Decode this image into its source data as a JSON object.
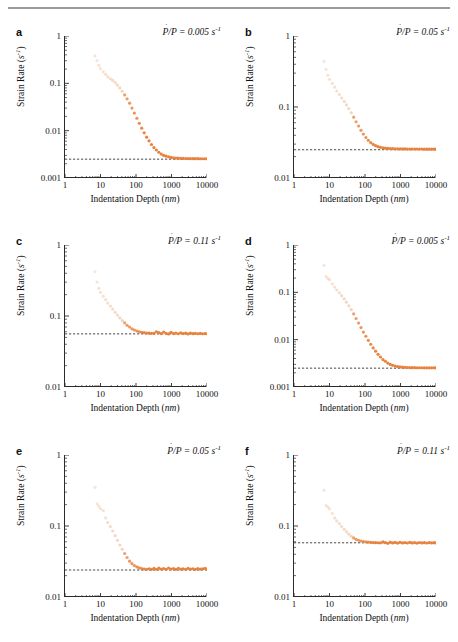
{
  "figure": {
    "type": "multi-panel-scatter",
    "panel_count": 6,
    "columns": 2,
    "rows": 3,
    "marker_color": "#E8823C",
    "marker_color_faded": "#EFC6A6",
    "axis_color": "#2b2b2b",
    "rule_color": "#9a9a9a"
  },
  "axes": {
    "xlabel_text": "Indentation Depth (",
    "xlabel_unit": "nm",
    "xlabel_close": ")",
    "ylabel_text": "Strain Rate (",
    "ylabel_unit": "s",
    "ylabel_exp": "-1",
    "ylabel_close": ")",
    "xticks": [
      "1",
      "10",
      "100",
      "1000",
      "10000"
    ],
    "xlim": [
      1,
      10000
    ],
    "yticks_3dec": [
      "1",
      "0.1",
      "0.01",
      "0.001"
    ],
    "yticks_2dec": [
      "1",
      "0.1",
      "0.01"
    ]
  },
  "annotation": {
    "numerator": "P",
    "denominator": "P",
    "separator": "/",
    "equals": " = ",
    "unit": "s",
    "unit_exp": "-1"
  },
  "chart_data": [
    {
      "panel": "a",
      "label": "a",
      "type": "scatter",
      "title": "",
      "xlabel": "Indentation Depth (nm)",
      "ylabel": "Strain Rate (s^-1)",
      "xlim": [
        1,
        10000
      ],
      "ylim": [
        0.001,
        1
      ],
      "xscale": "log",
      "yscale": "log",
      "grid": false,
      "legend": "none",
      "annotation_value": "0.005",
      "reference_line": 0.0025,
      "reference_line_style": "dashed",
      "x": [
        7,
        8,
        9,
        10,
        12,
        14,
        16,
        19,
        22,
        26,
        30,
        35,
        41,
        48,
        56,
        66,
        77,
        90,
        106,
        124,
        145,
        170,
        199,
        233,
        273,
        320,
        375,
        439,
        514,
        602,
        705,
        826,
        967,
        1133,
        1327,
        1554,
        1820,
        2132,
        2497,
        2925,
        3426,
        4013,
        4700,
        5505,
        6448,
        7553,
        8848,
        10000
      ],
      "y": [
        0.38,
        0.3,
        0.24,
        0.205,
        0.175,
        0.155,
        0.137,
        0.125,
        0.115,
        0.104,
        0.092,
        0.08,
        0.068,
        0.057,
        0.047,
        0.038,
        0.03,
        0.0235,
        0.0183,
        0.0143,
        0.0113,
        0.009,
        0.0073,
        0.0061,
        0.0051,
        0.0044,
        0.0039,
        0.0035,
        0.0032,
        0.003,
        0.0029,
        0.0028,
        0.00272,
        0.00268,
        0.00264,
        0.00262,
        0.0026,
        0.00259,
        0.00258,
        0.00257,
        0.00257,
        0.00256,
        0.00256,
        0.00256,
        0.00255,
        0.00255,
        0.00255,
        0.00255
      ]
    },
    {
      "panel": "b",
      "label": "b",
      "type": "scatter",
      "title": "",
      "xlabel": "Indentation Depth (nm)",
      "ylabel": "Strain Rate (s^-1)",
      "xlim": [
        1,
        10000
      ],
      "ylim": [
        0.01,
        1
      ],
      "xscale": "log",
      "yscale": "log",
      "grid": false,
      "legend": "none",
      "annotation_value": "0.05",
      "reference_line": 0.025,
      "reference_line_style": "dashed",
      "x": [
        7,
        8,
        9,
        10,
        12,
        14,
        16,
        19,
        22,
        26,
        30,
        35,
        41,
        48,
        56,
        66,
        77,
        90,
        106,
        124,
        145,
        170,
        199,
        233,
        273,
        320,
        375,
        439,
        514,
        602,
        705,
        826,
        967,
        1133,
        1327,
        1554,
        1820,
        2132,
        2497,
        2925,
        3426,
        4013,
        4700,
        5505,
        6448,
        7553,
        8848,
        10000
      ],
      "y": [
        0.44,
        0.34,
        0.28,
        0.245,
        0.215,
        0.19,
        0.168,
        0.15,
        0.134,
        0.12,
        0.107,
        0.095,
        0.083,
        0.072,
        0.062,
        0.054,
        0.047,
        0.0415,
        0.0372,
        0.034,
        0.0315,
        0.0297,
        0.0285,
        0.0276,
        0.027,
        0.0266,
        0.0263,
        0.0261,
        0.026,
        0.0259,
        0.0258,
        0.0258,
        0.0257,
        0.0257,
        0.0257,
        0.0256,
        0.0256,
        0.0256,
        0.0256,
        0.0256,
        0.0256,
        0.0256,
        0.0255,
        0.0255,
        0.0255,
        0.0255,
        0.0255,
        0.0255
      ]
    },
    {
      "panel": "c",
      "label": "c",
      "type": "scatter",
      "title": "",
      "xlabel": "Indentation Depth (nm)",
      "ylabel": "Strain Rate (s^-1)",
      "xlim": [
        1,
        10000
      ],
      "ylim": [
        0.01,
        1
      ],
      "xscale": "log",
      "yscale": "log",
      "grid": false,
      "legend": "none",
      "annotation_value": "0.11",
      "reference_line": 0.056,
      "reference_line_style": "dashed",
      "x": [
        7,
        8,
        9,
        10,
        12,
        14,
        16,
        19,
        22,
        26,
        30,
        35,
        41,
        48,
        56,
        66,
        77,
        90,
        106,
        124,
        145,
        170,
        199,
        233,
        273,
        320,
        375,
        439,
        514,
        602,
        705,
        826,
        967,
        1133,
        1327,
        1554,
        1820,
        2132,
        2497,
        2925,
        3426,
        4013,
        4700,
        5505,
        6448,
        7553,
        8848,
        10000
      ],
      "y": [
        0.42,
        0.3,
        0.245,
        0.215,
        0.19,
        0.17,
        0.152,
        0.138,
        0.125,
        0.113,
        0.103,
        0.094,
        0.086,
        0.08,
        0.074,
        0.07,
        0.066,
        0.0635,
        0.0615,
        0.06,
        0.059,
        0.0582,
        0.0576,
        0.0572,
        0.057,
        0.0568,
        0.06,
        0.0582,
        0.0566,
        0.0595,
        0.057,
        0.056,
        0.0588,
        0.0565,
        0.0575,
        0.0562,
        0.058,
        0.0566,
        0.0572,
        0.056,
        0.0575,
        0.0564,
        0.057,
        0.0562,
        0.0568,
        0.0562,
        0.0566,
        0.0562
      ]
    },
    {
      "panel": "d",
      "label": "d",
      "type": "scatter",
      "title": "",
      "xlabel": "Indentation Depth (nm)",
      "ylabel": "Strain Rate (s^-1)",
      "xlim": [
        1,
        10000
      ],
      "ylim": [
        0.001,
        1
      ],
      "xscale": "log",
      "yscale": "log",
      "grid": false,
      "legend": "none",
      "annotation_value": "0.005",
      "reference_line": 0.0025,
      "reference_line_style": "dashed",
      "x": [
        7,
        8,
        9,
        10,
        12,
        14,
        16,
        19,
        22,
        26,
        30,
        35,
        41,
        48,
        56,
        66,
        77,
        90,
        106,
        124,
        145,
        170,
        199,
        233,
        273,
        320,
        375,
        439,
        514,
        602,
        705,
        826,
        967,
        1133,
        1327,
        1554,
        1820,
        2132,
        2497,
        2925,
        3426,
        4013,
        4700,
        5505,
        6448,
        7553,
        8848,
        10000
      ],
      "y": [
        0.37,
        0.215,
        0.195,
        0.185,
        0.15,
        0.128,
        0.112,
        0.098,
        0.085,
        0.073,
        0.062,
        0.052,
        0.043,
        0.035,
        0.028,
        0.0225,
        0.018,
        0.0145,
        0.0118,
        0.0097,
        0.008,
        0.0067,
        0.0057,
        0.0049,
        0.0043,
        0.0038,
        0.0035,
        0.0032,
        0.003,
        0.00288,
        0.00278,
        0.0027,
        0.00265,
        0.00262,
        0.0026,
        0.00258,
        0.00257,
        0.00256,
        0.00256,
        0.00255,
        0.00255,
        0.00255,
        0.00254,
        0.00254,
        0.00254,
        0.00254,
        0.00254,
        0.00254
      ]
    },
    {
      "panel": "e",
      "label": "e",
      "type": "scatter",
      "title": "",
      "xlabel": "Indentation Depth (nm)",
      "ylabel": "Strain Rate (s^-1)",
      "xlim": [
        1,
        10000
      ],
      "ylim": [
        0.01,
        1
      ],
      "xscale": "log",
      "yscale": "log",
      "grid": false,
      "legend": "none",
      "annotation_value": "0.05",
      "reference_line": 0.024,
      "reference_line_style": "dashed",
      "x": [
        7,
        8,
        9,
        10,
        12,
        14,
        16,
        19,
        22,
        26,
        30,
        35,
        41,
        48,
        56,
        66,
        77,
        90,
        106,
        124,
        145,
        170,
        199,
        233,
        273,
        320,
        375,
        439,
        514,
        602,
        705,
        826,
        967,
        1133,
        1327,
        1554,
        1820,
        2132,
        2497,
        2925,
        3426,
        4013,
        4700,
        5505,
        6448,
        7553,
        8848,
        10000
      ],
      "y": [
        0.35,
        0.205,
        0.19,
        0.175,
        0.165,
        0.13,
        0.112,
        0.098,
        0.085,
        0.073,
        0.063,
        0.054,
        0.047,
        0.041,
        0.036,
        0.032,
        0.0295,
        0.0277,
        0.0265,
        0.0257,
        0.0252,
        0.0248,
        0.0246,
        0.025,
        0.0245,
        0.0253,
        0.0246,
        0.0255,
        0.0247,
        0.0252,
        0.0245,
        0.0256,
        0.0248,
        0.0251,
        0.0245,
        0.0254,
        0.0247,
        0.025,
        0.0245,
        0.0253,
        0.0247,
        0.025,
        0.0245,
        0.0252,
        0.0247,
        0.025,
        0.0253,
        0.0248
      ]
    },
    {
      "panel": "f",
      "label": "f",
      "type": "scatter",
      "title": "",
      "xlabel": "Indentation Depth (nm)",
      "ylabel": "Strain Rate (s^-1)",
      "xlim": [
        1,
        10000
      ],
      "ylim": [
        0.01,
        1
      ],
      "xscale": "log",
      "yscale": "log",
      "grid": false,
      "legend": "none",
      "annotation_value": "0.11",
      "reference_line": 0.058,
      "reference_line_style": "dashed",
      "x": [
        7,
        8,
        9,
        10,
        12,
        14,
        16,
        19,
        22,
        26,
        30,
        35,
        41,
        48,
        56,
        66,
        77,
        90,
        106,
        124,
        145,
        170,
        199,
        233,
        273,
        320,
        375,
        439,
        514,
        602,
        705,
        826,
        967,
        1133,
        1327,
        1554,
        1820,
        2132,
        2497,
        2925,
        3426,
        4013,
        4700,
        5505,
        6448,
        7553,
        8848,
        10000
      ],
      "y": [
        0.32,
        0.195,
        0.185,
        0.175,
        0.15,
        0.13,
        0.118,
        0.108,
        0.098,
        0.09,
        0.083,
        0.077,
        0.072,
        0.068,
        0.065,
        0.063,
        0.0615,
        0.0605,
        0.0598,
        0.0592,
        0.0588,
        0.0585,
        0.0583,
        0.0581,
        0.058,
        0.06,
        0.0583,
        0.057,
        0.0592,
        0.0578,
        0.0588,
        0.0575,
        0.059,
        0.0578,
        0.0585,
        0.0576,
        0.0588,
        0.0578,
        0.0583,
        0.0575,
        0.0586,
        0.0578,
        0.0582,
        0.0576,
        0.0584,
        0.0578,
        0.0582,
        0.0578
      ]
    }
  ]
}
